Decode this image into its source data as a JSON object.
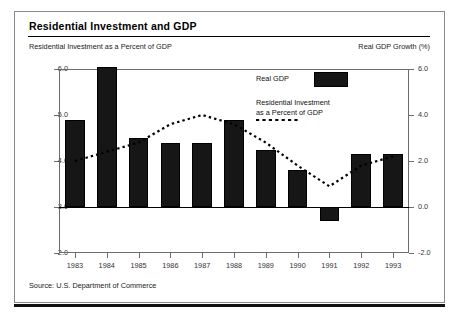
{
  "figure": {
    "title": "Residential Investment and GDP",
    "left_axis_label": "Residential Investment as a Percent of GDP",
    "right_axis_label": "Real GDP Growth (%)",
    "source": "Source: U.S. Department of Commerce"
  },
  "legend": {
    "bar_label": "Real GDP",
    "line_label": "Residential Investment\nas a Percent of GDP",
    "bar_color": "#161616",
    "line_style": "dotted"
  },
  "chart_data": {
    "type": "bar",
    "title": "Residential Investment and GDP",
    "subtitle": "",
    "xlabel": "",
    "ylabel": "Residential Investment as a Percent of GDP",
    "y2label": "Real GDP Growth (%)",
    "categories": [
      "1983",
      "1984",
      "1985",
      "1986",
      "1987",
      "1988",
      "1989",
      "1990",
      "1991",
      "1992",
      "1993"
    ],
    "ylim": [
      2.0,
      6.0
    ],
    "yticks": [
      "2.0",
      "3.0",
      "4.0",
      "5.0",
      "6.0"
    ],
    "y2lim": [
      -2.0,
      6.0
    ],
    "y2ticks": [
      "-2.0",
      "0.0",
      "2.0",
      "4.0",
      "6.0"
    ],
    "grid": false,
    "legend_position": "upper right",
    "series": [
      {
        "name": "Real GDP",
        "type": "bar",
        "axis": "right",
        "unit": "%",
        "values": [
          3.8,
          6.1,
          3.0,
          2.8,
          2.8,
          3.8,
          2.5,
          1.6,
          -0.6,
          2.3,
          2.3
        ]
      },
      {
        "name": "Residential Investment as a Percent of GDP",
        "type": "line",
        "axis": "left",
        "unit": "%",
        "values": [
          4.0,
          4.2,
          4.4,
          4.8,
          5.0,
          4.8,
          4.4,
          3.9,
          3.45,
          3.9,
          4.1
        ]
      }
    ]
  },
  "yticks_left": [
    {
      "label": "6.0",
      "value": 6.0
    },
    {
      "label": "5.0",
      "value": 5.0
    },
    {
      "label": "4.0",
      "value": 4.0
    },
    {
      "label": "3.0",
      "value": 3.0
    },
    {
      "label": "2.0",
      "value": 2.0
    }
  ],
  "yticks_right": [
    {
      "label": "6.0",
      "value": 6.0
    },
    {
      "label": "4.0",
      "value": 4.0
    },
    {
      "label": "2.0",
      "value": 2.0
    },
    {
      "label": "0.0",
      "value": 0.0
    },
    {
      "label": "-2.0",
      "value": -2.0
    }
  ]
}
